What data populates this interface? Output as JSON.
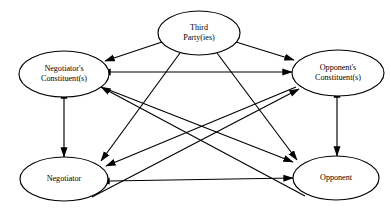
{
  "diagram": {
    "nodes": [
      {
        "id": "third-party",
        "lines": [
          "Third",
          "Party(ies)"
        ],
        "cx": 199,
        "cy": 33,
        "rx": 41,
        "ry": 22
      },
      {
        "id": "negotiators-constituents",
        "lines": [
          "Negotiator's",
          "Constituent(s)"
        ],
        "cx": 64,
        "cy": 74,
        "rx": 45,
        "ry": 23
      },
      {
        "id": "opponents-constituents",
        "lines": [
          "Opponent's",
          "Constituent(s)"
        ],
        "cx": 338,
        "cy": 73,
        "rx": 46,
        "ry": 23
      },
      {
        "id": "negotiator",
        "lines": [
          "Negotiator"
        ],
        "cx": 64,
        "cy": 179,
        "rx": 44,
        "ry": 22
      },
      {
        "id": "opponent",
        "lines": [
          "Opponent"
        ],
        "cx": 336,
        "cy": 178,
        "rx": 43,
        "ry": 22
      }
    ],
    "edges": [
      {
        "id": "third-party-to-negotiators-constituents",
        "from": "third-party",
        "to": "negotiators-constituents",
        "arrows": "end",
        "x1": 162,
        "y1": 42,
        "x2": 105,
        "y2": 61
      },
      {
        "id": "third-party-to-opponents-constituents",
        "from": "third-party",
        "to": "opponents-constituents",
        "arrows": "end",
        "x1": 236,
        "y1": 42,
        "x2": 294,
        "y2": 60
      },
      {
        "id": "third-party-to-negotiator",
        "from": "third-party",
        "to": "negotiator",
        "arrows": "end",
        "x1": 180,
        "y1": 53,
        "x2": 101,
        "y2": 161
      },
      {
        "id": "third-party-to-opponent",
        "from": "third-party",
        "to": "opponent",
        "arrows": "end",
        "x1": 217,
        "y1": 53,
        "x2": 297,
        "y2": 160
      },
      {
        "id": "constituents-horizontal",
        "from": "negotiators-constituents",
        "to": "opponents-constituents",
        "arrows": "both",
        "x1": 110,
        "y1": 72,
        "x2": 292,
        "y2": 72
      },
      {
        "id": "negotiator-opponent-horizontal",
        "from": "negotiator",
        "to": "opponent",
        "arrows": "both",
        "x1": 109,
        "y1": 181,
        "x2": 293,
        "y2": 178
      },
      {
        "id": "negotiators-constituents-negotiator-vertical",
        "from": "negotiators-constituents",
        "to": "negotiator",
        "arrows": "both",
        "x1": 64,
        "y1": 98,
        "x2": 64,
        "y2": 157
      },
      {
        "id": "opponents-constituents-opponent-vertical",
        "from": "opponents-constituents",
        "to": "opponent",
        "arrows": "both",
        "x1": 337,
        "y1": 97,
        "x2": 337,
        "y2": 156
      },
      {
        "id": "negotiators-constituents-to-opponent",
        "from": "negotiators-constituents",
        "to": "opponent",
        "arrows": "end",
        "x1": 104,
        "y1": 88,
        "x2": 293,
        "y2": 162
      },
      {
        "id": "opponents-constituents-to-negotiator",
        "from": "opponents-constituents",
        "to": "negotiator",
        "arrows": "end",
        "x1": 296,
        "y1": 87,
        "x2": 106,
        "y2": 166
      },
      {
        "id": "negotiator-to-opponents-constituents",
        "from": "negotiator",
        "to": "opponents-constituents",
        "arrows": "end",
        "x1": 92,
        "y1": 197,
        "x2": 299,
        "y2": 89
      },
      {
        "id": "opponent-to-negotiators-constituents",
        "from": "opponent",
        "to": "negotiators-constituents",
        "arrows": "end",
        "x1": 305,
        "y1": 196,
        "x2": 101,
        "y2": 87
      }
    ]
  }
}
